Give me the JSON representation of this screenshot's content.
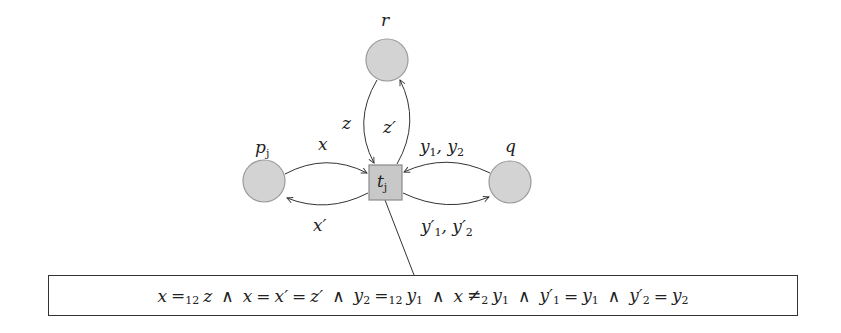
{
  "diagram": {
    "nodes": [
      {
        "id": "r",
        "label": "r",
        "shape": "circle",
        "cx": 387,
        "cy": 60,
        "r": 21
      },
      {
        "id": "p_j",
        "label": "p",
        "label_sub": "j",
        "shape": "circle",
        "cx": 264,
        "cy": 181,
        "r": 21
      },
      {
        "id": "q",
        "label": "q",
        "shape": "circle",
        "cx": 510,
        "cy": 182,
        "r": 21
      },
      {
        "id": "t_j",
        "label": "t",
        "label_sub": "j",
        "shape": "square",
        "x": 369,
        "y": 165,
        "w": 33,
        "h": 35
      }
    ],
    "edges": [
      {
        "from": "p_j",
        "to": "t_j",
        "label": "x"
      },
      {
        "from": "t_j",
        "to": "p_j",
        "label": "x′"
      },
      {
        "from": "r",
        "to": "t_j",
        "label": "z"
      },
      {
        "from": "t_j",
        "to": "r",
        "label": "z′"
      },
      {
        "from": "q",
        "to": "t_j",
        "label": "y₁, y₂"
      },
      {
        "from": "t_j",
        "to": "q",
        "label": "y′₁, y′₂"
      }
    ],
    "colors": {
      "node_fill": "#d3d3d3",
      "node_stroke": "#9a9a9a",
      "edge": "#333333",
      "text": "#222222"
    }
  },
  "labels": {
    "r": "r",
    "p": "p",
    "p_sub": "j",
    "q": "q",
    "t": "t",
    "t_sub": "j",
    "x": "x",
    "x_prime": "x′",
    "z": "z",
    "z_prime": "z′",
    "y1y2": {
      "a": "y",
      "a_sub": "1",
      "sep": ", ",
      "b": "y",
      "b_sub": "2"
    },
    "y1y2_prime": {
      "a": "y′",
      "a_sub": "1",
      "sep": ", ",
      "b": "y′",
      "b_sub": "2"
    }
  },
  "formula": {
    "text": "x =12 z ∧ x = x′ = z′ ∧ y2 =12 y1 ∧ x ≠2 y1 ∧ y′1 = y1 ∧ y′2 = y2",
    "parts": {
      "x": "x",
      "eq": "=",
      "sub12": "12",
      "z": "z",
      "and": "∧",
      "x_prime": "x′",
      "z_prime": "z′",
      "y": "y",
      "s1": "1",
      "s2": "2",
      "neq": "≠",
      "y_prime": "y′"
    }
  }
}
